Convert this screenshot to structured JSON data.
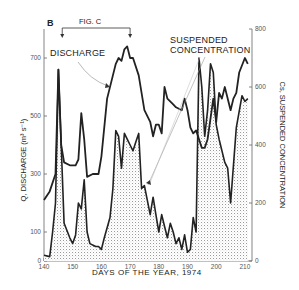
{
  "labels": {
    "panel": "B",
    "fig_ref": "FIG. C",
    "discharge": "DISCHARGE",
    "suspended_line1": "SUSPENDED",
    "suspended_line2": "CONCENTRATION",
    "xlabel": "DAYS OF THE YEAR, 1974",
    "ylabel_left": "Q, DISCHARGE (m³ s⁻¹)",
    "ylabel_right": "Cs, SUSPENDED CONCENTRATION"
  },
  "colors": {
    "line": "#222222",
    "stipple": "#bdbdbd",
    "axis": "#666666"
  },
  "chart_data": {
    "type": "line",
    "title": "",
    "xlabel": "DAYS OF THE YEAR, 1974",
    "ylabel": "Q, DISCHARGE (m³ s⁻¹)",
    "ylabel_right": "Cs, SUSPENDED CONCENTRATION",
    "xlim": [
      140,
      212
    ],
    "ylim": [
      0,
      800
    ],
    "ylim_right": [
      0,
      800
    ],
    "x_ticks": [
      140,
      150,
      160,
      170,
      180,
      190,
      200,
      210
    ],
    "y_ticks_left": [
      0,
      100,
      300,
      500,
      700
    ],
    "y_ticks_right": [
      0,
      200,
      400,
      600,
      800
    ],
    "annotations": [
      {
        "text": "FIG. C",
        "x_range": [
          146,
          170
        ]
      },
      {
        "text": "DISCHARGE",
        "points_to_day": 161
      },
      {
        "text": "SUSPENDED CONCENTRATION",
        "points_to_day": 176
      },
      {
        "text": "B",
        "position": "top-left"
      }
    ],
    "series": [
      {
        "name": "Discharge",
        "axis": "left",
        "style": "thick line",
        "x": [
          140,
          142,
          144,
          145,
          146,
          147,
          149,
          151,
          152,
          153,
          154,
          155,
          157,
          159,
          160,
          162,
          164,
          165,
          166,
          167,
          168,
          169,
          170,
          171,
          173,
          175,
          177,
          178,
          179,
          180,
          181,
          182,
          183,
          185,
          186,
          188,
          189,
          190,
          191,
          192,
          193,
          194,
          195,
          196,
          197,
          199,
          200,
          201,
          202,
          203,
          205,
          206,
          207,
          208,
          210,
          211
        ],
        "values": [
          210,
          240,
          300,
          660,
          400,
          340,
          330,
          330,
          350,
          510,
          420,
          290,
          300,
          300,
          360,
          560,
          640,
          680,
          700,
          690,
          730,
          740,
          700,
          700,
          640,
          520,
          480,
          430,
          470,
          470,
          440,
          600,
          560,
          540,
          530,
          520,
          560,
          520,
          460,
          440,
          450,
          420,
          390,
          390,
          420,
          560,
          480,
          580,
          560,
          600,
          520,
          560,
          580,
          650,
          700,
          680
        ]
      },
      {
        "name": "Suspended concentration",
        "axis": "right",
        "style": "thick line with stippled fill",
        "x": [
          140,
          142,
          143,
          144,
          145,
          146,
          147,
          149,
          150,
          151,
          152,
          153,
          154,
          155,
          156,
          158,
          159,
          160,
          161,
          163,
          164,
          165,
          166,
          167,
          168,
          169,
          170,
          171,
          172,
          173,
          174,
          175,
          176,
          177,
          178,
          179,
          180,
          181,
          182,
          183,
          184,
          185,
          186,
          187,
          188,
          189,
          190,
          191,
          192,
          193,
          194,
          195,
          196,
          197,
          198,
          199,
          200,
          201,
          203,
          204,
          205,
          207,
          209,
          210,
          211
        ],
        "values": [
          20,
          15,
          100,
          200,
          660,
          400,
          130,
          80,
          60,
          90,
          200,
          180,
          280,
          100,
          60,
          50,
          50,
          40,
          80,
          150,
          250,
          450,
          430,
          320,
          440,
          420,
          400,
          380,
          410,
          440,
          250,
          260,
          210,
          160,
          220,
          160,
          100,
          160,
          120,
          80,
          130,
          100,
          60,
          80,
          40,
          90,
          30,
          40,
          150,
          100,
          700,
          600,
          430,
          520,
          680,
          650,
          470,
          420,
          340,
          320,
          200,
          460,
          570,
          550,
          560
        ]
      }
    ],
    "grid": false,
    "legend": "inline annotations"
  }
}
